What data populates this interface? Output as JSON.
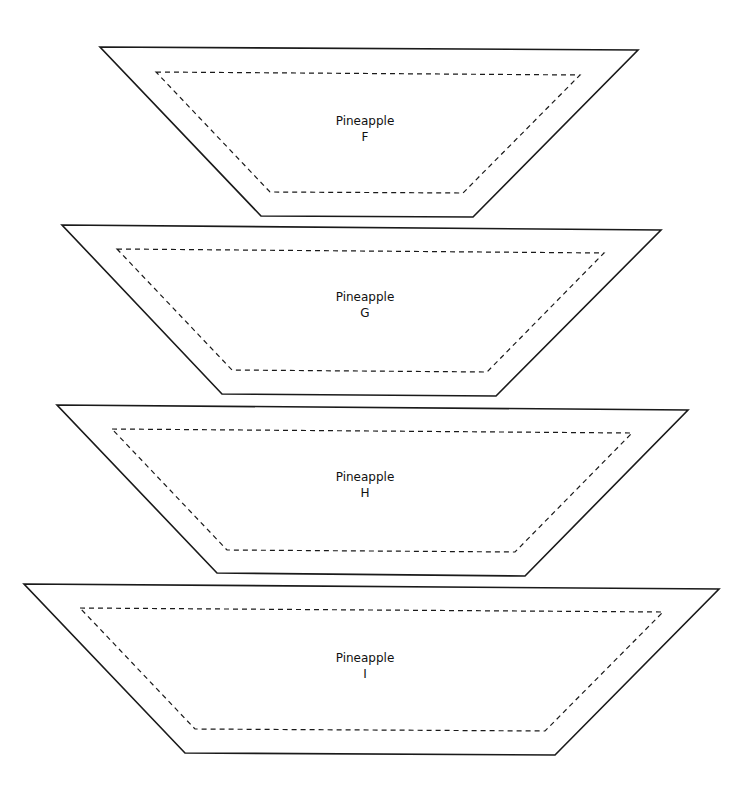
{
  "pieces": [
    {
      "name": "Pineapple",
      "letter": "F",
      "outer": "100,47 638,50 473,217 261,216",
      "inner": "156,72 580,75 463,193 270,192",
      "label_x": 365,
      "label_y1": 125,
      "label_y2": 141
    },
    {
      "name": "Pineapple",
      "letter": "G",
      "outer": "62,225 661,230 496,396 222,394",
      "inner": "117,249 604,253 487,372 232,370",
      "label_x": 365,
      "label_y1": 301,
      "label_y2": 317
    },
    {
      "name": "Pineapple",
      "letter": "H",
      "outer": "57,405 688,410 525,576 217,573",
      "inner": "112,429 632,433 515,552 227,550",
      "label_x": 365,
      "label_y1": 481,
      "label_y2": 497
    },
    {
      "name": "Pineapple",
      "letter": "I",
      "outer": "24,584 719,589 555,755 185,753",
      "inner": "80,608 663,612 545,731 195,729",
      "label_x": 365,
      "label_y1": 662,
      "label_y2": 678
    }
  ],
  "colors": {
    "background": "#ffffff",
    "stroke": "#1a1a1a"
  }
}
